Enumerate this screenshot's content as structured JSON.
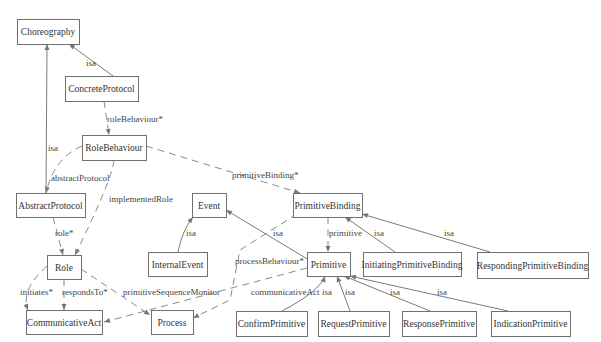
{
  "diagram": {
    "colors": {
      "box_border": "#707070",
      "line": "#7a7a7a",
      "text": "#333333",
      "background": "#ffffff"
    },
    "nodes": [
      {
        "id": "Choreography",
        "label": "Choreography"
      },
      {
        "id": "ConcreteProtocol",
        "label": "ConcreteProtocol"
      },
      {
        "id": "RoleBehaviour",
        "label": "RoleBehaviour"
      },
      {
        "id": "AbstractProtocol",
        "label": "AbstractProtocol"
      },
      {
        "id": "Role",
        "label": "Role"
      },
      {
        "id": "CommunicativeAct",
        "label": "CommunicativeAct"
      },
      {
        "id": "Process",
        "label": "Process"
      },
      {
        "id": "Event",
        "label": "Event"
      },
      {
        "id": "InternalEvent",
        "label": "InternalEvent"
      },
      {
        "id": "PrimitiveBinding",
        "label": "PrimitiveBinding"
      },
      {
        "id": "Primitive",
        "label": "Primitive"
      },
      {
        "id": "InitiatingPrimitiveBinding",
        "label": "InitiatingPrimitiveBinding"
      },
      {
        "id": "RespondingPrimitiveBinding",
        "label": "RespondingPrimitiveBinding"
      },
      {
        "id": "ConfirmPrimitive",
        "label": "ConfirmPrimitive"
      },
      {
        "id": "RequestPrimitive",
        "label": "RequestPrimitive"
      },
      {
        "id": "ResponsePrimitive",
        "label": "ResponsePrimitive"
      },
      {
        "id": "IndicationPrimitive",
        "label": "IndicationPrimitive"
      }
    ],
    "edges": [
      {
        "from": "ConcreteProtocol",
        "to": "Choreography",
        "label": "isa",
        "style": "solid"
      },
      {
        "from": "AbstractProtocol",
        "to": "Choreography",
        "label": "isa",
        "style": "solid"
      },
      {
        "from": "ConcreteProtocol",
        "to": "RoleBehaviour",
        "label": "roleBehaviour*",
        "style": "dashed"
      },
      {
        "from": "RoleBehaviour",
        "to": "AbstractProtocol",
        "label": "abstractProtocol",
        "style": "dashed"
      },
      {
        "from": "RoleBehaviour",
        "to": "Role",
        "label": "implementedRole",
        "style": "dashed"
      },
      {
        "from": "RoleBehaviour",
        "to": "PrimitiveBinding",
        "label": "primitiveBinding*",
        "style": "dashed"
      },
      {
        "from": "AbstractProtocol",
        "to": "Role",
        "label": "role*",
        "style": "dashed"
      },
      {
        "from": "Role",
        "to": "CommunicativeAct",
        "label": "initiates*",
        "style": "dashed"
      },
      {
        "from": "Role",
        "to": "CommunicativeAct",
        "label": "respondsTo*",
        "style": "dashed"
      },
      {
        "from": "Role",
        "to": "Process",
        "label": "primitiveSequenceMonitor",
        "style": "dashed"
      },
      {
        "from": "InternalEvent",
        "to": "Event",
        "label": "isa",
        "style": "solid"
      },
      {
        "from": "Primitive",
        "to": "Event",
        "label": "isa",
        "style": "solid"
      },
      {
        "from": "PrimitiveBinding",
        "to": "Primitive",
        "label": "primitive",
        "style": "dashed"
      },
      {
        "from": "PrimitiveBinding",
        "to": "Process",
        "label": "processBehaviour*",
        "style": "dashed"
      },
      {
        "from": "Primitive",
        "to": "CommunicativeAct",
        "label": "communicativeAct",
        "style": "dashed"
      },
      {
        "from": "InitiatingPrimitiveBinding",
        "to": "PrimitiveBinding",
        "label": "isa",
        "style": "solid"
      },
      {
        "from": "RespondingPrimitiveBinding",
        "to": "PrimitiveBinding",
        "label": "isa",
        "style": "solid"
      },
      {
        "from": "ConfirmPrimitive",
        "to": "Primitive",
        "label": "isa",
        "style": "solid"
      },
      {
        "from": "RequestPrimitive",
        "to": "Primitive",
        "label": "isa",
        "style": "solid"
      },
      {
        "from": "ResponsePrimitive",
        "to": "Primitive",
        "label": "isa",
        "style": "solid"
      },
      {
        "from": "IndicationPrimitive",
        "to": "Primitive",
        "label": "isa",
        "style": "solid"
      }
    ]
  }
}
